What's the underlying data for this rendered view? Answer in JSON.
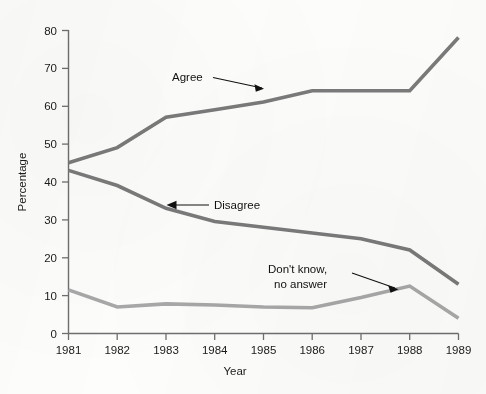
{
  "chart_data": {
    "type": "line",
    "title": "",
    "xlabel": "Year",
    "ylabel": "Percentage",
    "x": [
      1981,
      1982,
      1983,
      1984,
      1985,
      1986,
      1987,
      1988,
      1989
    ],
    "xtick_labels": [
      "1981",
      "1982",
      "1983",
      "1984",
      "1985",
      "1986",
      "1987",
      "1988",
      "1989"
    ],
    "ytick_labels": [
      "0",
      "10",
      "20",
      "30",
      "40",
      "50",
      "60",
      "70",
      "80"
    ],
    "yticks": [
      0,
      10,
      20,
      30,
      40,
      50,
      60,
      70,
      80
    ],
    "ylim": [
      0,
      80
    ],
    "xlim": [
      1981,
      1989
    ],
    "grid": false,
    "legend": "annotations-with-leader-lines",
    "series": [
      {
        "name": "Agree",
        "color": "#7a7a7a",
        "values": [
          45,
          49,
          57,
          59,
          61,
          64,
          64,
          64,
          78
        ]
      },
      {
        "name": "Disagree",
        "color": "#7a7a7a",
        "values": [
          43,
          39,
          33,
          29.5,
          28,
          26.5,
          25,
          22,
          13
        ]
      },
      {
        "name": "Don't know, no answer",
        "color": "#a8a8a8",
        "values": [
          11.5,
          7,
          7.8,
          7.5,
          7,
          6.8,
          9.5,
          12.5,
          4
        ]
      }
    ],
    "annotations": [
      {
        "id": "agree",
        "text": "Agree",
        "lines": [
          "Agree"
        ]
      },
      {
        "id": "disagree",
        "text": "Disagree",
        "lines": [
          "Disagree"
        ]
      },
      {
        "id": "dontknow",
        "text": "Don't know, no answer",
        "lines": [
          "Don't know,",
          "no answer"
        ]
      }
    ]
  }
}
